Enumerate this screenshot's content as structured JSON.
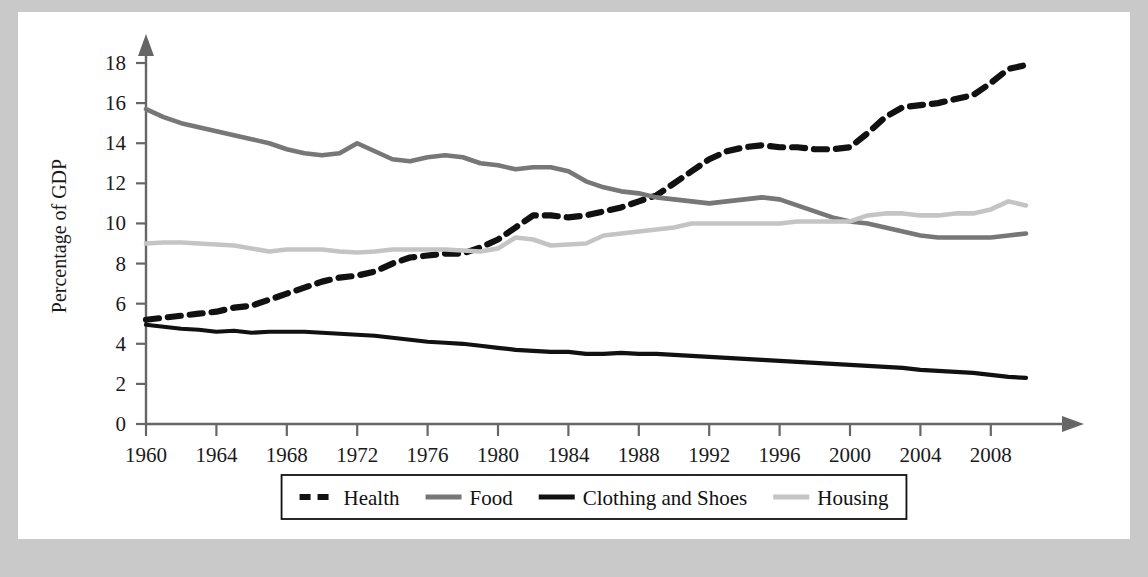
{
  "figure": {
    "ylabel": "Percentage of GDP",
    "xlabel": "",
    "title": "",
    "background_color": "#ffffff",
    "page_color": "#c9c9c9"
  },
  "legend": {
    "position": "bottom-center",
    "entries": [
      {
        "label": "Health",
        "color": "#111111",
        "style": "dashed"
      },
      {
        "label": "Food",
        "color": "#777777",
        "style": "solid"
      },
      {
        "label": "Clothing and Shoes",
        "color": "#111111",
        "style": "solid"
      },
      {
        "label": "Housing",
        "color": "#c4c4c4",
        "style": "solid"
      }
    ]
  },
  "axes": {
    "y_ticks": [
      "0",
      "2",
      "4",
      "6",
      "8",
      "10",
      "12",
      "14",
      "16",
      "18"
    ],
    "x_ticks": [
      "1960",
      "1964",
      "1968",
      "1972",
      "1976",
      "1980",
      "1984",
      "1988",
      "1992",
      "1996",
      "2000",
      "2004",
      "2008"
    ]
  },
  "chart_data": {
    "type": "line",
    "title": "",
    "xlabel": "",
    "ylabel": "Percentage of GDP",
    "xlim": [
      1960,
      2010
    ],
    "ylim": [
      0,
      18
    ],
    "grid": false,
    "legend_position": "bottom-center",
    "x": [
      1960,
      1961,
      1962,
      1963,
      1964,
      1965,
      1966,
      1967,
      1968,
      1969,
      1970,
      1971,
      1972,
      1973,
      1974,
      1975,
      1976,
      1977,
      1978,
      1979,
      1980,
      1981,
      1982,
      1983,
      1984,
      1985,
      1986,
      1987,
      1988,
      1989,
      1990,
      1991,
      1992,
      1993,
      1994,
      1995,
      1996,
      1997,
      1998,
      1999,
      2000,
      2001,
      2002,
      2003,
      2004,
      2005,
      2006,
      2007,
      2008,
      2009,
      2010
    ],
    "series": [
      {
        "name": "Health",
        "color": "#111111",
        "style": "dashed",
        "values": [
          5.2,
          5.3,
          5.4,
          5.5,
          5.6,
          5.8,
          5.9,
          6.2,
          6.5,
          6.8,
          7.1,
          7.3,
          7.4,
          7.6,
          8.0,
          8.3,
          8.4,
          8.5,
          8.5,
          8.8,
          9.2,
          9.8,
          10.4,
          10.4,
          10.3,
          10.4,
          10.6,
          10.8,
          11.1,
          11.4,
          12.0,
          12.6,
          13.2,
          13.6,
          13.8,
          13.9,
          13.8,
          13.8,
          13.7,
          13.7,
          13.8,
          14.5,
          15.3,
          15.8,
          15.9,
          16.0,
          16.2,
          16.4,
          17.0,
          17.7,
          17.9
        ]
      },
      {
        "name": "Food",
        "color": "#777777",
        "style": "solid",
        "values": [
          15.7,
          15.3,
          15.0,
          14.8,
          14.6,
          14.4,
          14.2,
          14.0,
          13.7,
          13.5,
          13.4,
          13.5,
          14.0,
          13.6,
          13.2,
          13.1,
          13.3,
          13.4,
          13.3,
          13.0,
          12.9,
          12.7,
          12.8,
          12.8,
          12.6,
          12.1,
          11.8,
          11.6,
          11.5,
          11.3,
          11.2,
          11.1,
          11.0,
          11.1,
          11.2,
          11.3,
          11.2,
          10.9,
          10.6,
          10.3,
          10.1,
          10.0,
          9.8,
          9.6,
          9.4,
          9.3,
          9.3,
          9.3,
          9.3,
          9.4,
          9.5
        ]
      },
      {
        "name": "Clothing and Shoes",
        "color": "#111111",
        "style": "solid",
        "values": [
          4.95,
          4.85,
          4.75,
          4.7,
          4.6,
          4.65,
          4.55,
          4.6,
          4.6,
          4.6,
          4.55,
          4.5,
          4.45,
          4.4,
          4.3,
          4.2,
          4.1,
          4.05,
          4.0,
          3.9,
          3.8,
          3.7,
          3.65,
          3.6,
          3.6,
          3.5,
          3.5,
          3.55,
          3.5,
          3.5,
          3.45,
          3.4,
          3.35,
          3.3,
          3.25,
          3.2,
          3.15,
          3.1,
          3.05,
          3.0,
          2.95,
          2.9,
          2.85,
          2.8,
          2.7,
          2.65,
          2.6,
          2.55,
          2.45,
          2.35,
          2.3
        ]
      },
      {
        "name": "Housing",
        "color": "#c4c4c4",
        "style": "solid",
        "values": [
          9.0,
          9.05,
          9.05,
          9.0,
          8.95,
          8.9,
          8.75,
          8.6,
          8.7,
          8.7,
          8.7,
          8.6,
          8.55,
          8.6,
          8.7,
          8.7,
          8.7,
          8.7,
          8.65,
          8.6,
          8.75,
          9.3,
          9.2,
          8.9,
          8.95,
          9.0,
          9.4,
          9.5,
          9.6,
          9.7,
          9.8,
          10.0,
          10.0,
          10.0,
          10.0,
          10.0,
          10.0,
          10.1,
          10.1,
          10.1,
          10.1,
          10.4,
          10.5,
          10.5,
          10.4,
          10.4,
          10.5,
          10.5,
          10.7,
          11.1,
          10.9
        ]
      }
    ]
  }
}
